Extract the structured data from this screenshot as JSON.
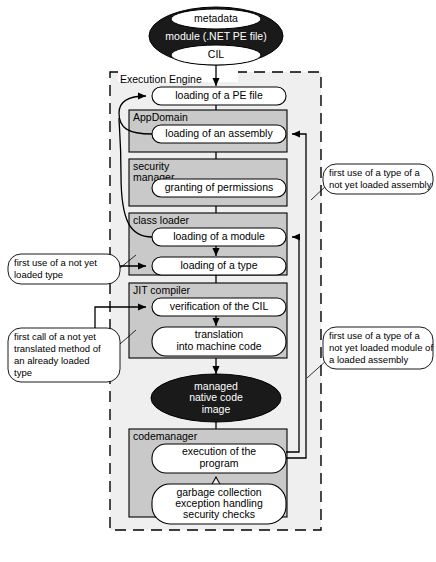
{
  "figure": {
    "caption": ""
  },
  "top_module": {
    "metadata_label": "metadata",
    "module_label": "module (.NET PE file)",
    "cil_label": "CIL"
  },
  "frame": {
    "label": "Execution Engine"
  },
  "nodes": {
    "loading_pe_file": "loading of a PE file",
    "loading_assembly": "loading of an assembly",
    "granting_permissions": "granting of permissions",
    "loading_module": "loading of a module",
    "loading_type": "loading of a type",
    "verification_cil": "verification of the CIL",
    "translation_line1": "translation",
    "translation_line2": "into machine code",
    "execution_line1": "execution of the",
    "execution_line2": "program",
    "gc_line1": "garbage collection",
    "gc_line2": "exception handling",
    "gc_line3": "security checks"
  },
  "groups": {
    "appdomain": "AppDomain",
    "security_manager_line1": "security",
    "security_manager_line2": "manager",
    "class_loader": "class loader",
    "jit_compiler": "JIT compiler",
    "codemanager": "codemanager"
  },
  "native_image": {
    "line1": "managed",
    "line2": "native code",
    "line3": "image"
  },
  "callouts": {
    "left_type": {
      "line1": "first use of a not yet",
      "line2": "loaded type"
    },
    "left_method": {
      "line1": "first call of a not yet",
      "line2": "translated method of",
      "line3": "an   already   loaded",
      "line4": "type"
    },
    "right_assembly": {
      "line1": "first use of a type of a",
      "line2": "not yet loaded assembly"
    },
    "right_module": {
      "line1": "first use of a type of a",
      "line2": "not yet loaded module of",
      "line3": "a loaded assembly"
    }
  },
  "colors": {
    "group_fill": "#c9c9c9",
    "node_fill": "#ffffff",
    "dark_ellipse": "#1a1a1a",
    "frame_fill": "#efefef",
    "line": "#000000"
  }
}
